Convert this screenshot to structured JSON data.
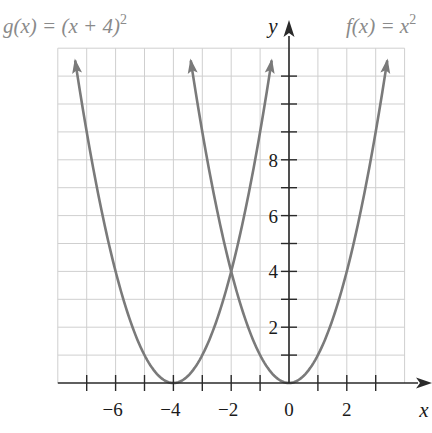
{
  "chart_data": {
    "type": "line",
    "title": "",
    "xlabel": "x",
    "ylabel": "y",
    "xlim": [
      -8,
      4.3
    ],
    "ylim": [
      0,
      12
    ],
    "grid": true,
    "x_ticks": [
      -7,
      -6,
      -5,
      -4,
      -3,
      -2,
      -1,
      0,
      1,
      2,
      3
    ],
    "x_tick_labels": [
      "-6",
      "-4",
      "-2",
      "0",
      "2"
    ],
    "x_tick_label_values": [
      -6,
      -4,
      -2,
      0,
      2
    ],
    "y_ticks": [
      1,
      2,
      3,
      4,
      5,
      6,
      7,
      8,
      9,
      10,
      11
    ],
    "y_tick_labels": [
      "2",
      "4",
      "6",
      "8"
    ],
    "y_tick_label_values": [
      2,
      4,
      6,
      8
    ],
    "series": [
      {
        "name": "f(x) = x^2",
        "label_text": "f(x) = x",
        "label_sup": "2",
        "expression": "x^2",
        "x": [
          -3.4,
          -3,
          -2,
          -1,
          0,
          1,
          2,
          3,
          3.4
        ],
        "values": [
          11.56,
          9,
          4,
          1,
          0,
          1,
          4,
          9,
          11.56
        ],
        "color": "#7a7a7a"
      },
      {
        "name": "g(x) = (x + 4)^2",
        "label_text": "g(x) = (x + 4)",
        "label_sup": "2",
        "expression": "(x+4)^2",
        "x": [
          -7.4,
          -7,
          -6,
          -5,
          -4,
          -3,
          -2,
          -1,
          -0.6
        ],
        "values": [
          11.56,
          9,
          4,
          1,
          0,
          1,
          4,
          9,
          11.56
        ],
        "color": "#7a7a7a"
      }
    ],
    "annotations": [
      {
        "text": "intersection",
        "x": -2,
        "y": 4
      }
    ]
  },
  "colors": {
    "grid": "#cfcfcf",
    "axis": "#2a2a2a",
    "curve": "#7a7a7a",
    "label_gray": "#8a8a8a"
  }
}
